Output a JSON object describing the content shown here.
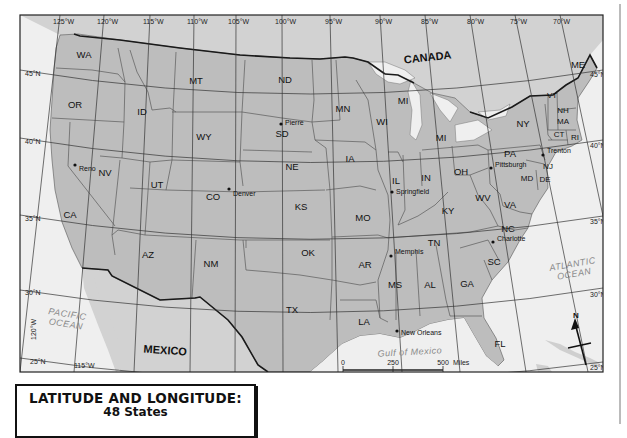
{
  "title": {
    "main": "LATITUDE AND LONGITUDE:",
    "sub": "48 States"
  },
  "colors": {
    "land_us": "#bdbdbd",
    "land_other": "#d4d4d4",
    "water": "#efefef",
    "border": "#222222",
    "grid": "#333333"
  },
  "longitude_labels_top": [
    {
      "text": "125°W",
      "x": 53,
      "y": 24
    },
    {
      "text": "120°W",
      "x": 97,
      "y": 24
    },
    {
      "text": "115°W",
      "x": 143,
      "y": 24
    },
    {
      "text": "110°W",
      "x": 187,
      "y": 24
    },
    {
      "text": "105°W",
      "x": 228,
      "y": 24
    },
    {
      "text": "100°W",
      "x": 275,
      "y": 24
    },
    {
      "text": "95°W",
      "x": 325,
      "y": 24
    },
    {
      "text": "90°W",
      "x": 375,
      "y": 24
    },
    {
      "text": "85°W",
      "x": 421,
      "y": 24
    },
    {
      "text": "80°W",
      "x": 467,
      "y": 24
    },
    {
      "text": "75°W",
      "x": 510,
      "y": 24
    },
    {
      "text": "70°W",
      "x": 553,
      "y": 24
    }
  ],
  "longitude_labels_bottom": [
    {
      "text": "115°W",
      "x": 74,
      "y": 368
    },
    {
      "text": "110°W",
      "x": 140,
      "y": 379
    },
    {
      "text": "105°W",
      "x": 205,
      "y": 379
    },
    {
      "text": "100°W",
      "x": 268,
      "y": 379
    },
    {
      "text": "95°W",
      "x": 330,
      "y": 398
    },
    {
      "text": "90°W",
      "x": 397,
      "y": 398
    },
    {
      "text": "85°W",
      "x": 456,
      "y": 391
    },
    {
      "text": "80°W",
      "x": 520,
      "y": 398
    },
    {
      "text": "75°W",
      "x": 583,
      "y": 398
    }
  ],
  "latitude_labels_left": [
    {
      "text": "45°N",
      "x": 25,
      "y": 76
    },
    {
      "text": "40°N",
      "x": 25,
      "y": 144
    },
    {
      "text": "35°N",
      "x": 25,
      "y": 221
    },
    {
      "text": "30°N",
      "x": 25,
      "y": 295
    },
    {
      "text": "25°N",
      "x": 30,
      "y": 364
    }
  ],
  "latitude_labels_right": [
    {
      "text": "45°N",
      "x": 590,
      "y": 77
    },
    {
      "text": "40°N",
      "x": 590,
      "y": 148
    },
    {
      "text": "35°N",
      "x": 590,
      "y": 224
    },
    {
      "text": "30°N",
      "x": 590,
      "y": 297
    },
    {
      "text": "25°N",
      "x": 590,
      "y": 370
    }
  ],
  "rotated_labels": [
    {
      "text": "120°W",
      "x": 36,
      "y": 340,
      "rotate": -90
    },
    {
      "text": "70°W",
      "x": 611,
      "y": 185,
      "rotate": 90
    }
  ],
  "states": [
    {
      "abbr": "WA",
      "x": 84,
      "y": 58
    },
    {
      "abbr": "OR",
      "x": 75,
      "y": 108
    },
    {
      "abbr": "CA",
      "x": 70,
      "y": 218
    },
    {
      "abbr": "NV",
      "x": 105,
      "y": 176
    },
    {
      "abbr": "ID",
      "x": 142,
      "y": 115
    },
    {
      "abbr": "MT",
      "x": 196,
      "y": 84
    },
    {
      "abbr": "WY",
      "x": 204,
      "y": 140
    },
    {
      "abbr": "UT",
      "x": 157,
      "y": 188
    },
    {
      "abbr": "CO",
      "x": 213,
      "y": 200
    },
    {
      "abbr": "AZ",
      "x": 148,
      "y": 258
    },
    {
      "abbr": "NM",
      "x": 211,
      "y": 267
    },
    {
      "abbr": "ND",
      "x": 285,
      "y": 83
    },
    {
      "abbr": "SD",
      "x": 282,
      "y": 137
    },
    {
      "abbr": "NE",
      "x": 292,
      "y": 170
    },
    {
      "abbr": "KS",
      "x": 301,
      "y": 210
    },
    {
      "abbr": "OK",
      "x": 308,
      "y": 256
    },
    {
      "abbr": "TX",
      "x": 292,
      "y": 313
    },
    {
      "abbr": "MN",
      "x": 343,
      "y": 112
    },
    {
      "abbr": "IA",
      "x": 350,
      "y": 162
    },
    {
      "abbr": "MO",
      "x": 363,
      "y": 221
    },
    {
      "abbr": "AR",
      "x": 365,
      "y": 268
    },
    {
      "abbr": "LA",
      "x": 364,
      "y": 325
    },
    {
      "abbr": "WI",
      "x": 382,
      "y": 125
    },
    {
      "abbr": "IL",
      "x": 396,
      "y": 184
    },
    {
      "abbr": "MS",
      "x": 395,
      "y": 288
    },
    {
      "abbr": "MI",
      "x": 403,
      "y": 104
    },
    {
      "abbr": "MI",
      "x": 441,
      "y": 141
    },
    {
      "abbr": "IN",
      "x": 426,
      "y": 181
    },
    {
      "abbr": "KY",
      "x": 448,
      "y": 214
    },
    {
      "abbr": "TN",
      "x": 434,
      "y": 246
    },
    {
      "abbr": "AL",
      "x": 430,
      "y": 288
    },
    {
      "abbr": "OH",
      "x": 461,
      "y": 175
    },
    {
      "abbr": "GA",
      "x": 467,
      "y": 287
    },
    {
      "abbr": "WV",
      "x": 483,
      "y": 201
    },
    {
      "abbr": "VA",
      "x": 510,
      "y": 208
    },
    {
      "abbr": "NC",
      "x": 508,
      "y": 232
    },
    {
      "abbr": "SC",
      "x": 494,
      "y": 265
    },
    {
      "abbr": "FL",
      "x": 500,
      "y": 347
    },
    {
      "abbr": "PA",
      "x": 510,
      "y": 157
    },
    {
      "abbr": "NY",
      "x": 523,
      "y": 127
    },
    {
      "abbr": "MD",
      "x": 527,
      "y": 181
    },
    {
      "abbr": "DE",
      "x": 545,
      "y": 182
    },
    {
      "abbr": "NJ",
      "x": 548,
      "y": 169
    },
    {
      "abbr": "VT",
      "x": 552,
      "y": 98
    },
    {
      "abbr": "NH",
      "x": 563,
      "y": 113
    },
    {
      "abbr": "MA",
      "x": 563,
      "y": 124
    },
    {
      "abbr": "CT",
      "x": 559,
      "y": 137
    },
    {
      "abbr": "RI",
      "x": 575,
      "y": 140
    },
    {
      "abbr": "ME",
      "x": 578,
      "y": 68
    }
  ],
  "cities": [
    {
      "name": "Reno",
      "x": 75,
      "y": 165,
      "lx": 79,
      "ly": 171
    },
    {
      "name": "Pierre",
      "x": 281,
      "y": 124,
      "lx": 285,
      "ly": 125
    },
    {
      "name": "Denver",
      "x": 229,
      "y": 189,
      "lx": 233,
      "ly": 196
    },
    {
      "name": "Springfield",
      "x": 392,
      "y": 192,
      "lx": 396,
      "ly": 194
    },
    {
      "name": "Memphis",
      "x": 391,
      "y": 256,
      "lx": 395,
      "ly": 254
    },
    {
      "name": "New Orleans",
      "x": 397,
      "y": 331,
      "lx": 401,
      "ly": 335
    },
    {
      "name": "Pittsburgh",
      "x": 491,
      "y": 168,
      "lx": 495,
      "ly": 167
    },
    {
      "name": "Trenton",
      "x": 543,
      "y": 155,
      "lx": 547,
      "ly": 153
    },
    {
      "name": "Charlotte",
      "x": 493,
      "y": 242,
      "lx": 497,
      "ly": 241
    }
  ],
  "countries": [
    {
      "name": "CANADA",
      "x": 428,
      "y": 61,
      "rotate": -6
    },
    {
      "name": "MEXICO",
      "x": 165,
      "y": 354,
      "rotate": 4
    }
  ],
  "water_bodies": [
    {
      "lines": [
        "PACIFIC",
        "OCEAN"
      ],
      "x": 67,
      "y": 317,
      "rotate": 9
    },
    {
      "lines": [
        "ATLANTIC",
        "OCEAN"
      ],
      "x": 573,
      "y": 267,
      "rotate": -10
    },
    {
      "lines": [
        "Gulf of Mexico"
      ],
      "x": 410,
      "y": 355,
      "rotate": -3
    }
  ],
  "scale_bar": {
    "miles_ticks": [
      "0",
      "250",
      "500"
    ],
    "miles_unit": "Miles",
    "km_ticks": [
      "0",
      "250",
      "500",
      "750"
    ],
    "km_unit": "Kilometers"
  },
  "compass": {
    "label": "N"
  }
}
